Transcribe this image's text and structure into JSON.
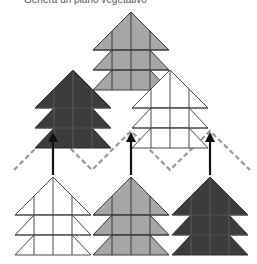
{
  "caption": "Genera un piano vegetativo",
  "colors": {
    "grey": "#a6a6a6",
    "dark": "#3c3c3c",
    "white": "#ffffff",
    "line": "#4a4a4a",
    "dash": "#9a9a9a",
    "arrow": "#111111"
  },
  "trees": [
    {
      "name": "top-grey-tree",
      "fill": "grey",
      "cx": 131,
      "apex": 14
    },
    {
      "name": "middle-dark-tree",
      "fill": "dark",
      "cx": 73,
      "apex": 72
    },
    {
      "name": "middle-white-tree",
      "fill": "white",
      "cx": 170,
      "apex": 72
    },
    {
      "name": "bottom-white-tree",
      "fill": "white",
      "cx": 53,
      "apex": 178
    },
    {
      "name": "bottom-grey-tree",
      "fill": "grey",
      "cx": 131,
      "apex": 178
    },
    {
      "name": "bottom-dark-tree",
      "fill": "dark",
      "cx": 210,
      "apex": 178
    }
  ],
  "arrows": [
    {
      "name": "arrow-left",
      "x": 53
    },
    {
      "name": "arrow-center",
      "x": 131
    },
    {
      "name": "arrow-right",
      "x": 210
    }
  ]
}
